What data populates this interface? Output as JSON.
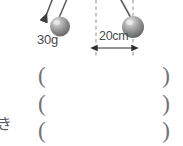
{
  "figure": {
    "type": "physics-pendulum-diagram",
    "background_color": "#ffffff",
    "pendulums": [
      {
        "id": "left-pendulum",
        "label": "30g",
        "bob_color": "#8e8e8e",
        "bob_highlight_color": "#d8d8d8",
        "bob_center": {
          "x": 60,
          "y": 26
        },
        "bob_radius": 10,
        "strings": [
          {
            "from": {
              "x": 52,
              "y": 0
            },
            "to": {
              "x": 44,
              "y": 18
            },
            "has_arrowhead": true
          },
          {
            "from": {
              "x": 66,
              "y": 0
            },
            "to": {
              "x": 58,
              "y": 19
            },
            "has_arrowhead": false
          }
        ]
      },
      {
        "id": "right-pendulum",
        "label": "",
        "bob_color": "#8e8e8e",
        "bob_highlight_color": "#d8d8d8",
        "bob_center": {
          "x": 133,
          "y": 27
        },
        "bob_radius": 11,
        "strings": [
          {
            "from": {
              "x": 121,
              "y": 0
            },
            "to": {
              "x": 132,
              "y": 18
            },
            "has_arrowhead": false
          }
        ]
      }
    ],
    "guides": [
      {
        "id": "guide-line-left",
        "x": 96,
        "y_start": 0,
        "y_end": 58,
        "style": "dashed",
        "color": "#9a9a9a"
      },
      {
        "id": "guide-line-right",
        "x": 133,
        "y_start": 0,
        "y_end": 58,
        "style": "dashed",
        "color": "#9a9a9a"
      }
    ],
    "dimension": {
      "id": "distance-dimension",
      "label": "20cm",
      "x_start": 96,
      "x_end": 133,
      "y": 48,
      "arrow_both_ends": true,
      "color": "#3a3a3a"
    }
  },
  "labels": {
    "mass": "30g",
    "distance": "20cm",
    "left_kanji_fragment": "き"
  },
  "answer_rows": [
    {
      "id": "answer-blank-1",
      "open": "(",
      "close": ")",
      "value": ""
    },
    {
      "id": "answer-blank-2",
      "open": "(",
      "close": ")",
      "value": ""
    },
    {
      "id": "answer-blank-3",
      "open": "(",
      "close": ")",
      "value": ""
    }
  ],
  "colors": {
    "ink": "#3a3a3a",
    "paren": "#6e7275",
    "guide": "#9a9a9a",
    "bob_dark": "#6b6b6b",
    "bob_mid": "#9a9a9a",
    "bob_light": "#e2e2e2",
    "string": "#5a5a5a"
  }
}
